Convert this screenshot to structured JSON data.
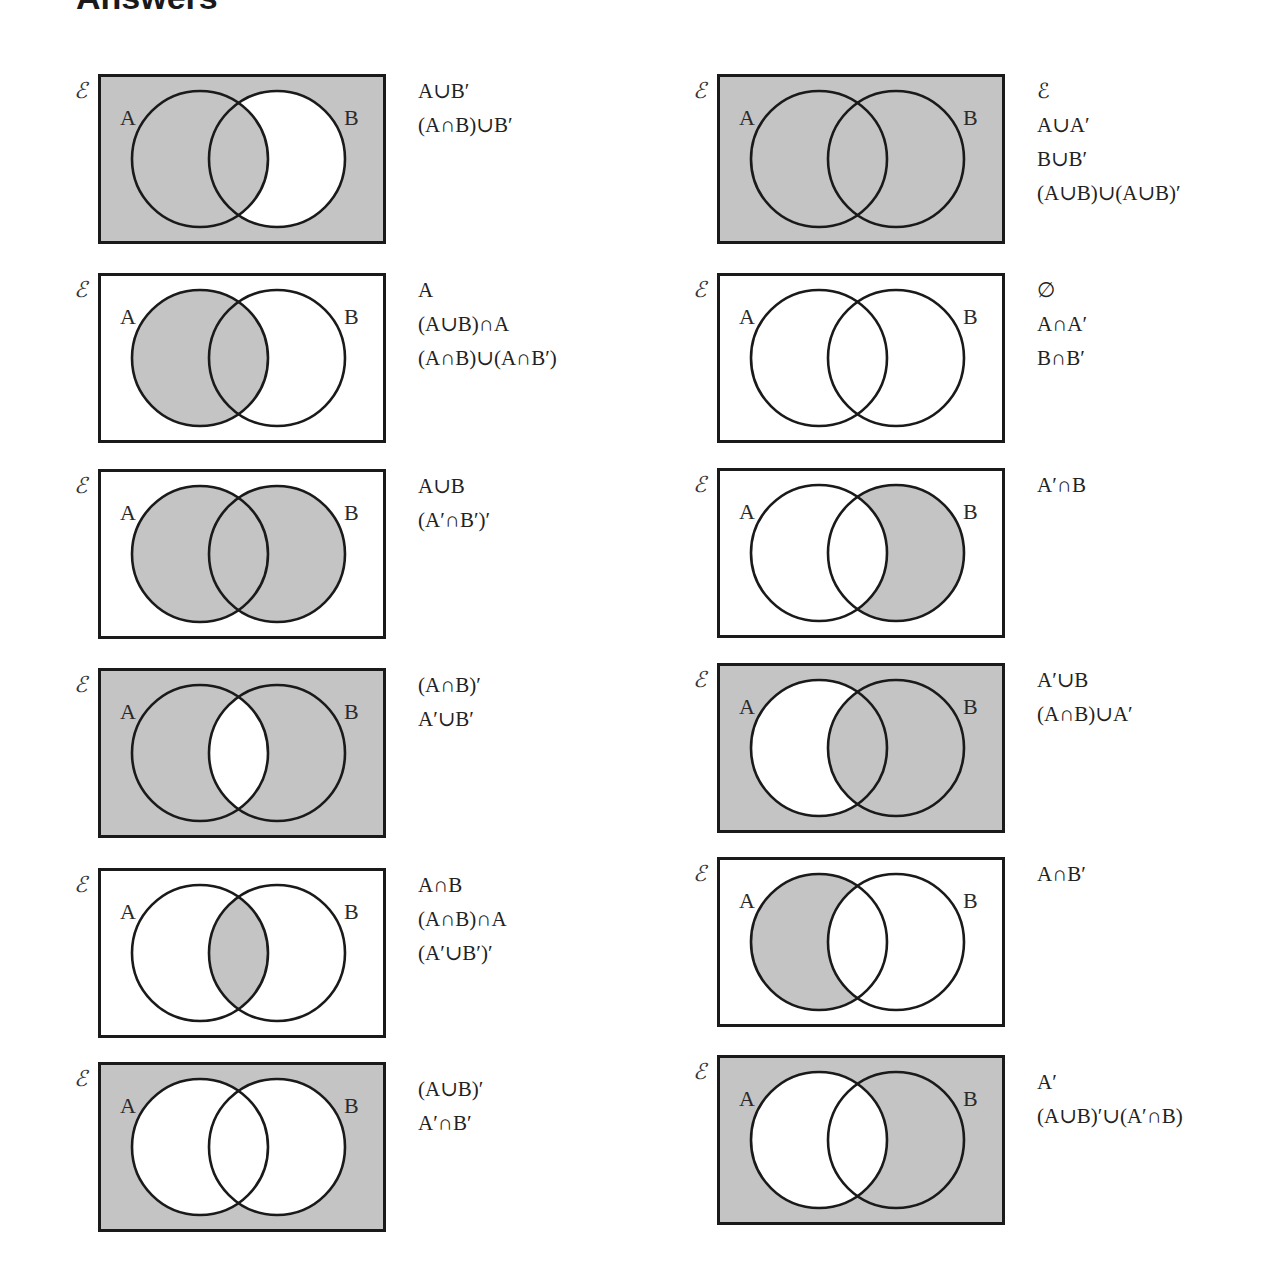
{
  "page": {
    "title": "Answers"
  },
  "universal_symbol": "ℰ",
  "set_labels": {
    "a": "A",
    "b": "B"
  },
  "colors": {
    "shade": "#c4c4c4",
    "stroke": "#1a1a1a",
    "background": "#ffffff"
  },
  "diagrams": [
    {
      "id": "l1",
      "column": "left",
      "row": 1,
      "shaded_regions": [
        "onlyA",
        "both",
        "outside"
      ],
      "expressions": [
        "A∪B′",
        "(A∩B)∪B′"
      ]
    },
    {
      "id": "l2",
      "column": "left",
      "row": 2,
      "shaded_regions": [
        "onlyA",
        "both"
      ],
      "expressions": [
        "A",
        "(A∪B)∩A",
        "(A∩B)∪(A∩B′)"
      ]
    },
    {
      "id": "l3",
      "column": "left",
      "row": 3,
      "shaded_regions": [
        "onlyA",
        "both",
        "onlyB"
      ],
      "expressions": [
        "A∪B",
        "(A′∩B′)′"
      ]
    },
    {
      "id": "l4",
      "column": "left",
      "row": 4,
      "shaded_regions": [
        "onlyA",
        "onlyB",
        "outside"
      ],
      "expressions": [
        "(A∩B)′",
        "A′∪B′"
      ]
    },
    {
      "id": "l5",
      "column": "left",
      "row": 5,
      "shaded_regions": [
        "both"
      ],
      "expressions": [
        "A∩B",
        "(A∩B)∩A",
        "(A′∪B′)′"
      ]
    },
    {
      "id": "l6",
      "column": "left",
      "row": 6,
      "shaded_regions": [
        "outside"
      ],
      "expressions": [
        "(A∪B)′",
        "A′∩B′"
      ]
    },
    {
      "id": "r1",
      "column": "right",
      "row": 1,
      "shaded_regions": [
        "onlyA",
        "both",
        "onlyB",
        "outside"
      ],
      "expressions": [
        "ℰ",
        "A∪A′",
        "B∪B′",
        "(A∪B)∪(A∪B)′"
      ]
    },
    {
      "id": "r2",
      "column": "right",
      "row": 2,
      "shaded_regions": [],
      "expressions": [
        "∅",
        "A∩A′",
        "B∩B′"
      ]
    },
    {
      "id": "r3",
      "column": "right",
      "row": 3,
      "shaded_regions": [
        "onlyB"
      ],
      "expressions": [
        "A′∩B"
      ]
    },
    {
      "id": "r4",
      "column": "right",
      "row": 4,
      "shaded_regions": [
        "both",
        "onlyB",
        "outside"
      ],
      "expressions": [
        "A′∪B",
        "(A∩B)∪A′"
      ]
    },
    {
      "id": "r5",
      "column": "right",
      "row": 5,
      "shaded_regions": [
        "onlyA"
      ],
      "expressions": [
        "A∩B′"
      ]
    },
    {
      "id": "r6",
      "column": "right",
      "row": 6,
      "shaded_regions": [
        "onlyB",
        "outside"
      ],
      "expressions": [
        "A′",
        "(A∪B)′∪(A′∩B)"
      ]
    }
  ]
}
